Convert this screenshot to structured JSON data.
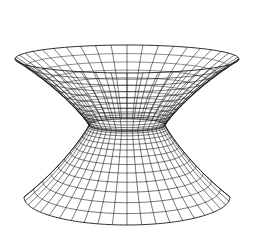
{
  "figure": {
    "title": "Wireframe surface of revolution (wormhole / hyperboloid shape)",
    "background": "#ffffff",
    "line_color": "#1a1a1a",
    "width": 257,
    "height": 241
  },
  "surface": {
    "type": "surface-of-revolution-wireframe",
    "center_x": 127,
    "top": {
      "y": 59,
      "rx": 112,
      "ry": 14
    },
    "throat": {
      "y": 125,
      "rx": 38,
      "ry": 6
    },
    "bottom": {
      "y": 197,
      "rx": 103,
      "ry": 28
    },
    "meridians": 44,
    "upper_rings": 14,
    "lower_rings": 14
  }
}
